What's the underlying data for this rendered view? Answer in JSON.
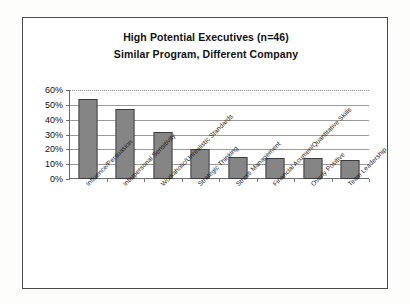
{
  "chart_data": {
    "type": "bar",
    "title": "High Potential Executives (n=46)",
    "subtitle": "Similar Program, Different Company",
    "title_lines": [
      "High Potential Executives (n=46)",
      "Similar Program, Different Company"
    ],
    "categories": [
      "Influence/Persuasion",
      "Interpersonal Sensitivity",
      "Workaholic/Unrealistic Standards",
      "Strategic Thinking",
      "Stress Management",
      "Financial Acumen/Quantitative Skills",
      "Overly Positive",
      "Team Leadership"
    ],
    "values": [
      54,
      47,
      32,
      20,
      15,
      14,
      14,
      13
    ],
    "value_labels": [
      "54%",
      "47%",
      "32%",
      "20%",
      "15%",
      "14%",
      "14%",
      "13%"
    ],
    "xlabel": "",
    "ylabel": "",
    "ylim": [
      0,
      60
    ],
    "ytick_values": [
      0,
      10,
      20,
      30,
      40,
      50,
      60
    ],
    "ytick_labels": [
      "0%",
      "10%",
      "20%",
      "30%",
      "40%",
      "50%",
      "60%"
    ],
    "grid": true,
    "grid_orientation": "horizontal",
    "legend": false,
    "legend_position": "none",
    "bar_fill_color": "#9b9b9b",
    "bar_border_color": "#3c3c3c",
    "bar_pattern": "fine-checker",
    "label_rotation_degrees": -45,
    "frame_border_color": "#4a4a4a",
    "background_color": "#ffffff"
  },
  "yaxis": {
    "ticks": [
      {
        "label": "60%",
        "value": 60
      },
      {
        "label": "50%",
        "value": 50
      },
      {
        "label": "40%",
        "value": 40
      },
      {
        "label": "30%",
        "value": 30
      },
      {
        "label": "20%",
        "value": 20
      },
      {
        "label": "10%",
        "value": 10
      },
      {
        "label": "0%",
        "value": 0
      }
    ]
  },
  "bars": [
    {
      "category": "Influence/Persuasion",
      "value": 54
    },
    {
      "category": "Interpersonal Sensitivity",
      "value": 47
    },
    {
      "category": "Workaholic/Unrealistic Standards",
      "value": 32
    },
    {
      "category": "Strategic Thinking",
      "value": 20
    },
    {
      "category": "Stress Management",
      "value": 15
    },
    {
      "category": "Financial Acumen/Quantitative Skills",
      "value": 14
    },
    {
      "category": "Overly Positive",
      "value": 14
    },
    {
      "category": "Team Leadership",
      "value": 13
    }
  ]
}
